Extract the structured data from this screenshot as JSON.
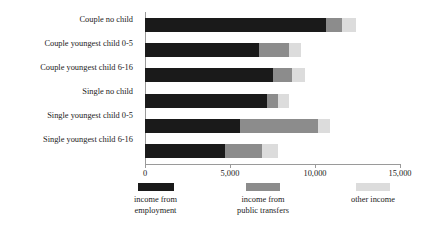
{
  "chart_data": {
    "type": "bar",
    "orientation": "horizontal",
    "stacked": true,
    "title": "",
    "xlabel": "",
    "ylabel": "",
    "xlim": [
      0,
      15000
    ],
    "grid": false,
    "legend_position": "bottom",
    "xticks": [
      0,
      5000,
      10000,
      15000
    ],
    "xtick_labels": [
      "0",
      "5,000",
      "10,000",
      "15,000"
    ],
    "categories": [
      "Couple no child",
      "Couple youngest child 0-5",
      "Couple youngest child 6-16",
      "Single no child",
      "Single youngest child 0-5",
      "Single youngest child 6-16"
    ],
    "series": [
      {
        "name": "income from employment",
        "color": "#1a1a1a",
        "values": [
          10650,
          6700,
          7500,
          7200,
          5600,
          4700
        ]
      },
      {
        "name": "income from public transfers",
        "color": "#8c8c8c",
        "values": [
          950,
          1750,
          1150,
          600,
          4550,
          2200
        ]
      },
      {
        "name": "other income",
        "color": "#dcdcdc",
        "values": [
          800,
          700,
          750,
          650,
          750,
          950
        ]
      }
    ],
    "totals": [
      12400,
      9150,
      9400,
      8450,
      10900,
      7850
    ]
  },
  "legend": {
    "items": [
      {
        "label": "income from\nemployment",
        "color": "#1a1a1a",
        "swatch": "legend-swatch-employment"
      },
      {
        "label": "income from\npublic transfers",
        "color": "#8c8c8c",
        "swatch": "legend-swatch-public-transfers"
      },
      {
        "label": "other income",
        "color": "#dcdcdc",
        "swatch": "legend-swatch-other-income"
      }
    ]
  }
}
